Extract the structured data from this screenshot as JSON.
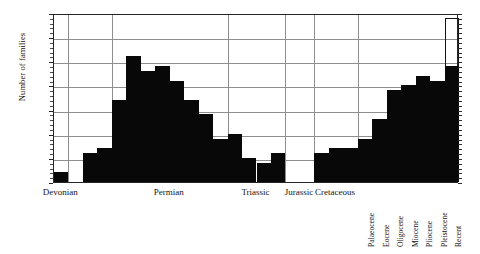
{
  "chart_data": {
    "type": "bar",
    "title": "",
    "subtitle": "",
    "xlabel": "",
    "ylabel": "Number of families",
    "ylim": [
      0,
      35
    ],
    "ytick_values": [
      0,
      5,
      10,
      15,
      20,
      25,
      30,
      35
    ],
    "ytick_labels": [
      "0",
      "5",
      "10",
      "15",
      "20",
      "25",
      "30",
      "35"
    ],
    "grid": true,
    "legend": "none",
    "period_labels": [
      "Devonian",
      "Permian",
      "Triassic",
      "Jurassic",
      "Cretaceous"
    ],
    "epoch_labels": [
      "Palaeocene",
      "Eocene",
      "Oligocene",
      "Miocene",
      "Pliocene",
      "Pleistocene",
      "Recent"
    ],
    "bar_color": "#080808",
    "open_bar_note": "Recent",
    "categories": [
      "Devonian",
      "Carboniferous-1",
      "Carboniferous-2",
      "Carboniferous-3",
      "Permian-1",
      "Permian-2",
      "Permian-3",
      "Permian-4",
      "Permian-5",
      "Permian-6",
      "Permian-7",
      "Permian-8",
      "Triassic-1",
      "Triassic-2",
      "Triassic-3",
      "Triassic-4",
      "Jurassic-1",
      "Jurassic-2",
      "Cretaceous-1",
      "Cretaceous-2",
      "Cretaceous-3",
      "Palaeocene",
      "Eocene",
      "Oligocene",
      "Miocene",
      "Pliocene",
      "Pleistocene",
      "Recent"
    ],
    "values": [
      2,
      0,
      6,
      7,
      17,
      26,
      23,
      24,
      21,
      17,
      14,
      9,
      10,
      5,
      4,
      6,
      0,
      0,
      6,
      7,
      7,
      9,
      13,
      19,
      20,
      22,
      21,
      24
    ],
    "open_values": [
      null,
      null,
      null,
      null,
      null,
      null,
      null,
      null,
      null,
      null,
      null,
      null,
      null,
      null,
      null,
      null,
      null,
      null,
      null,
      null,
      null,
      null,
      null,
      null,
      null,
      null,
      null,
      34
    ]
  }
}
